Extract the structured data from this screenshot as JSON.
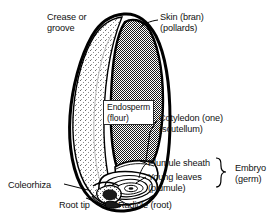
{
  "figure": {
    "background_color": "#ffffff",
    "ink_color": "#000000",
    "endosperm_fill": "#808080",
    "crease_fill": "#f2f2f2"
  },
  "labels": {
    "crease": "Crease or\ngroove",
    "skin": "Skin (bran)\n(pollards)",
    "endosperm": "Endosperm\n(flour)",
    "cotyledon": "Cotyledon (one)\n(scutellum)",
    "plumule_sheath": "Plumule sheath",
    "young_leaves": "Young leaves\n(plumule)",
    "embryo": "Embryo\n(germ)",
    "coleorhiza": "Coleorhiza",
    "root_tip": "Root tip",
    "radicle": "Radicle (root)"
  },
  "parts": [
    {
      "id": "skin",
      "name": "Skin (bran) (pollards)",
      "region": "outer-coat"
    },
    {
      "id": "crease",
      "name": "Crease or groove",
      "region": "left-lobe"
    },
    {
      "id": "endosperm",
      "name": "Endosperm (flour)",
      "region": "central-mass"
    },
    {
      "id": "cotyledon",
      "name": "Cotyledon (one) (scutellum)",
      "region": "lower-shield"
    },
    {
      "id": "plumule-sheath",
      "name": "Plumule sheath",
      "region": "embryo"
    },
    {
      "id": "young-leaves",
      "name": "Young leaves (plumule)",
      "region": "embryo"
    },
    {
      "id": "radicle",
      "name": "Radicle (root)",
      "region": "embryo"
    },
    {
      "id": "root-tip",
      "name": "Root tip",
      "region": "embryo"
    },
    {
      "id": "coleorhiza",
      "name": "Coleorhiza",
      "region": "embryo"
    },
    {
      "id": "embryo",
      "name": "Embryo (germ)",
      "region": "bracket-group"
    }
  ]
}
